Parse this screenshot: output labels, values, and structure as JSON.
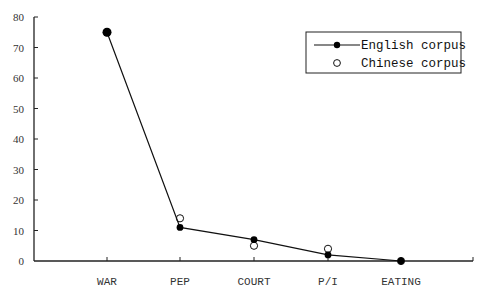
{
  "chart_data": {
    "type": "line",
    "title": "",
    "xlabel": "",
    "ylabel": "",
    "categories": [
      "WAR",
      "PEP",
      "COURT",
      "P/I",
      "EATING"
    ],
    "series": [
      {
        "name": "English corpus",
        "style": "line-filled-marker",
        "color": "#000000",
        "values": [
          75,
          11,
          7,
          2,
          0
        ]
      },
      {
        "name": "Chinese corpus",
        "style": "open-marker-only",
        "color": "#000000",
        "values": [
          75,
          14,
          5,
          4,
          0
        ]
      }
    ],
    "ylim": [
      0,
      80
    ],
    "yticks": [
      0,
      10,
      20,
      30,
      40,
      50,
      60,
      70,
      80
    ],
    "grid": false,
    "legend_position": "upper right"
  },
  "legend": {
    "items": [
      "English corpus",
      "Chinese corpus"
    ]
  }
}
